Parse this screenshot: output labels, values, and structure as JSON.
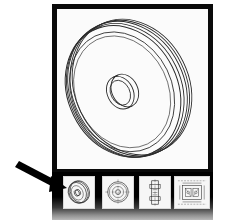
{
  "document": {
    "title": "CAD Drawing Viewer",
    "frame_color": "#0a0a0a",
    "page_background": "#ffffff",
    "panel_background": "#fbfbfb"
  },
  "main_view": {
    "name": "pulley-isometric-view",
    "description": "Isometric line drawing of a grooved pulley / flywheel disc",
    "line_color": "#2b2b2b"
  },
  "thumbnail_strip": {
    "background_color": "#000000",
    "thumbnails": [
      {
        "id": "thumb-1",
        "label": "Isometric pulley view",
        "type": "isometric",
        "selected": true
      },
      {
        "id": "thumb-2",
        "label": "Front plan view",
        "type": "concentric-circles",
        "selected": false
      },
      {
        "id": "thumb-3",
        "label": "Section profile view",
        "type": "vertical-section",
        "selected": false
      },
      {
        "id": "thumb-4",
        "label": "Assembly detail view",
        "type": "assembly-detail",
        "selected": false
      }
    ]
  },
  "annotation": {
    "name": "pointer-arrow",
    "color": "#000000",
    "points_to": "thumb-1"
  }
}
